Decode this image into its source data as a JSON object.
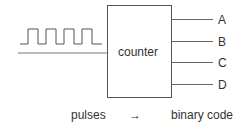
{
  "diagram": {
    "block_label": "counter",
    "outputs": [
      "A",
      "B",
      "C",
      "D"
    ],
    "input_signal": "square-wave-pulses",
    "caption": {
      "left": "pulses",
      "arrow": "→",
      "right": "binary code"
    }
  },
  "colors": {
    "line": "#555555",
    "text": "#333333"
  }
}
